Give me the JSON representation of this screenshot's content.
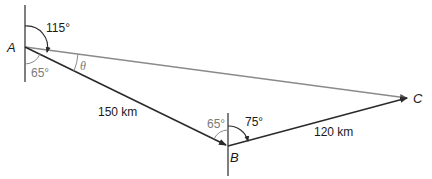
{
  "diagram": {
    "type": "bearing-vector-diagram",
    "points": [
      {
        "id": "A",
        "label": "A",
        "x": 25,
        "y": 47
      },
      {
        "id": "B",
        "label": "B",
        "x": 228,
        "y": 146
      },
      {
        "id": "C",
        "label": "C",
        "x": 409,
        "y": 98
      }
    ],
    "edges": [
      {
        "from": "A",
        "to": "B",
        "label": "150 km",
        "style": "dark",
        "arrow": true
      },
      {
        "from": "B",
        "to": "C",
        "label": "120 km",
        "style": "dark",
        "arrow": true
      },
      {
        "from": "A",
        "to": "C",
        "label": "",
        "style": "gray",
        "arrow": true
      }
    ],
    "angles": {
      "a_bearing": "115°",
      "a_south": "65°",
      "theta": "θ",
      "b_north_west": "65°",
      "b_bearing": "75°"
    },
    "labels": {
      "A": "A",
      "B": "B",
      "C": "C",
      "ab_length": "150 km",
      "bc_length": "120 km"
    },
    "colors": {
      "dark_line": "#2a2a2a",
      "gray_line": "#8a8a8a",
      "gray_text": "#7a7a7a"
    }
  }
}
